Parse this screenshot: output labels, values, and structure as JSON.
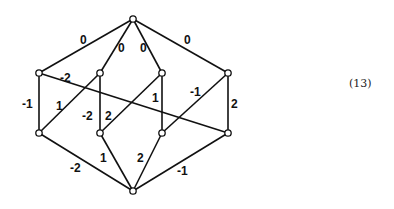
{
  "equation_number": "(13)",
  "graph": {
    "nodes": [
      {
        "id": "top",
        "x": 133,
        "y": 19
      },
      {
        "id": "lu",
        "x": 39,
        "y": 73
      },
      {
        "id": "mlu",
        "x": 100,
        "y": 73
      },
      {
        "id": "mru",
        "x": 162,
        "y": 73
      },
      {
        "id": "ru",
        "x": 228,
        "y": 73
      },
      {
        "id": "ll",
        "x": 39,
        "y": 133
      },
      {
        "id": "mll",
        "x": 100,
        "y": 133
      },
      {
        "id": "mrl",
        "x": 162,
        "y": 133
      },
      {
        "id": "rl",
        "x": 228,
        "y": 133
      },
      {
        "id": "bot",
        "x": 133,
        "y": 191
      }
    ],
    "edges": [
      {
        "from": "top",
        "to": "lu",
        "label": "0",
        "lx": 80,
        "ly": 44
      },
      {
        "from": "top",
        "to": "mlu",
        "label": "0",
        "lx": 118,
        "ly": 52
      },
      {
        "from": "top",
        "to": "mru",
        "label": "0",
        "lx": 140,
        "ly": 52
      },
      {
        "from": "top",
        "to": "ru",
        "label": "0",
        "lx": 184,
        "ly": 44
      },
      {
        "from": "lu",
        "to": "ll",
        "label": "-1",
        "lx": 22,
        "ly": 108
      },
      {
        "from": "lu",
        "to": "rl",
        "label": "-2",
        "lx": 60,
        "ly": 82
      },
      {
        "from": "mlu",
        "to": "ll",
        "label": "1",
        "lx": 56,
        "ly": 110
      },
      {
        "from": "mlu",
        "to": "mll",
        "label": "-2",
        "lx": 82,
        "ly": 120
      },
      {
        "from": "mru",
        "to": "mll",
        "label": "2",
        "lx": 105,
        "ly": 120
      },
      {
        "from": "mru",
        "to": "mrl",
        "label": "1",
        "lx": 152,
        "ly": 102
      },
      {
        "from": "ru",
        "to": "mrl",
        "label": "-1",
        "lx": 190,
        "ly": 96
      },
      {
        "from": "ru",
        "to": "rl",
        "label": "2",
        "lx": 231,
        "ly": 108
      },
      {
        "from": "ll",
        "to": "bot",
        "label": "-2",
        "lx": 70,
        "ly": 172
      },
      {
        "from": "mll",
        "to": "bot",
        "label": "1",
        "lx": 100,
        "ly": 162
      },
      {
        "from": "mrl",
        "to": "bot",
        "label": "2",
        "lx": 137,
        "ly": 162
      },
      {
        "from": "rl",
        "to": "bot",
        "label": "-1",
        "lx": 177,
        "ly": 175
      }
    ]
  }
}
